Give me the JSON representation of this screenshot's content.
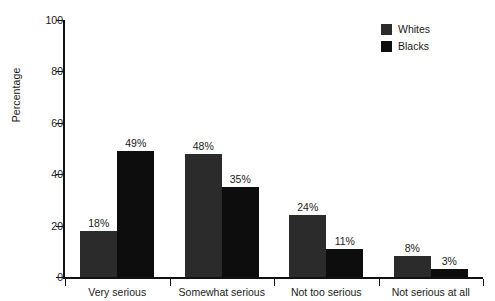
{
  "chart_data": {
    "type": "bar",
    "title": "",
    "xlabel": "",
    "ylabel": "Percentage",
    "ylim": [
      0,
      100
    ],
    "yticks": [
      0,
      20,
      40,
      60,
      80,
      100
    ],
    "ytick_labels": [
      "0",
      "20",
      "40",
      "60",
      "80",
      "100"
    ],
    "grid": false,
    "legend_position": "top-right",
    "categories": [
      "Very serious",
      "Somewhat serious",
      "Not too serious",
      "Not serious at all"
    ],
    "series": [
      {
        "name": "Whites",
        "color": "#2b2b2b",
        "values": [
          18,
          48,
          24,
          8
        ],
        "value_labels": [
          "18%",
          "48%",
          "24%",
          "8%"
        ]
      },
      {
        "name": "Blacks",
        "color": "#0d0d0d",
        "values": [
          49,
          35,
          11,
          3
        ],
        "value_labels": [
          "49%",
          "35%",
          "11%",
          "3%"
        ]
      }
    ]
  },
  "legend": {
    "items": [
      {
        "label": "Whites",
        "color": "#2b2b2b"
      },
      {
        "label": "Blacks",
        "color": "#0d0d0d"
      }
    ]
  },
  "axes": {
    "y_title": "Percentage"
  }
}
